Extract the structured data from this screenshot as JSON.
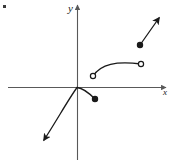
{
  "figure": {
    "kind": "cartesian-graph-sketch",
    "background_color": "#ffffff",
    "ink_color": "#1a1a1a",
    "axis_color": "#595959",
    "width": 170,
    "height": 166
  },
  "axes": {
    "x_axis": {
      "label": "x",
      "label_x": 163,
      "label_y": 95,
      "start_x": 8,
      "end_x": 166,
      "y": 87,
      "arrow_at": "right"
    },
    "y_axis": {
      "label": "y",
      "label_x": 68,
      "label_y": 12,
      "x": 77,
      "start_y": 160,
      "end_y": 5,
      "arrow_at": "top"
    },
    "origin": {
      "x": 77,
      "y": 87
    }
  },
  "marks": {
    "corner_tick": {
      "x": 3,
      "y": 5,
      "width": 3,
      "height": 3
    }
  },
  "chart_data": {
    "type": "line",
    "title": "",
    "xlabel": "x",
    "ylabel": "y",
    "grid": false,
    "legend": null,
    "branches": [
      {
        "name": "origin-branch",
        "shape": "smooth-curve",
        "start_marker": "arrow",
        "end_marker": "closed-circle",
        "path": "M 44 140 C 57 120 68 100 77 87.5 C 83 88 89 93 95 99",
        "points": [
          {
            "x": 44,
            "y": 140,
            "marker": "arrow",
            "role": "arrow-tip-lower-left"
          },
          {
            "x": 77,
            "y": 87,
            "marker": "none",
            "role": "passes-through-origin"
          },
          {
            "x": 95,
            "y": 99,
            "marker": "closed-circle",
            "role": "included-endpoint"
          }
        ]
      },
      {
        "name": "middle-arc",
        "shape": "concave-down-arc",
        "start_marker": "open-circle",
        "end_marker": "open-circle",
        "path": "M 93 76 C 101 64 116 61 141 64",
        "points": [
          {
            "x": 93,
            "y": 76,
            "marker": "open-circle",
            "role": "excluded-left-endpoint"
          },
          {
            "x": 141,
            "y": 64,
            "marker": "open-circle",
            "role": "excluded-right-endpoint"
          }
        ]
      },
      {
        "name": "upper-right-ray",
        "shape": "straight-ray",
        "start_marker": "closed-circle",
        "end_marker": "arrow",
        "path": "M 140 45 L 159 18",
        "points": [
          {
            "x": 140,
            "y": 45,
            "marker": "closed-circle",
            "role": "included-endpoint"
          },
          {
            "x": 159,
            "y": 18,
            "marker": "arrow",
            "role": "arrow-tip-upper-right"
          }
        ]
      }
    ]
  }
}
